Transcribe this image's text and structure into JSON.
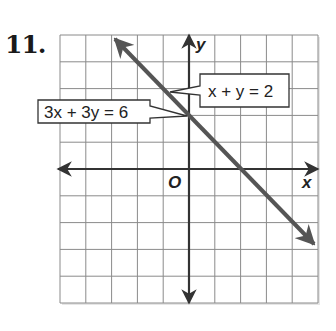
{
  "problem": {
    "number": "11."
  },
  "axes": {
    "x_label": "x",
    "y_label": "y",
    "origin_label": "O"
  },
  "callouts": [
    {
      "id": "eq1",
      "text": "x + y = 2"
    },
    {
      "id": "eq2",
      "text": "3x + 3y = 6"
    }
  ],
  "colors": {
    "line": "#555555",
    "axis": "#333333",
    "grid": "#8a8a8a"
  },
  "chart_data": {
    "type": "line",
    "title": "",
    "xlabel": "x",
    "ylabel": "y",
    "xlim": [
      -5,
      5
    ],
    "ylim": [
      -5,
      5
    ],
    "grid": true,
    "grid_step": 1,
    "series": [
      {
        "name": "x + y = 2",
        "equivalent": "3x + 3y = 6",
        "slope": -1,
        "y_intercept": 2,
        "x_intercept": 2,
        "x": [
          -3,
          -2,
          -1,
          0,
          1,
          2,
          3,
          4,
          5
        ],
        "y": [
          5,
          4,
          3,
          2,
          1,
          0,
          -1,
          -2,
          -3
        ]
      }
    ],
    "annotations": [
      "x + y = 2",
      "3x + 3y = 6"
    ],
    "note": "Both equations graph as the same line (coincident); infinitely many solutions."
  }
}
